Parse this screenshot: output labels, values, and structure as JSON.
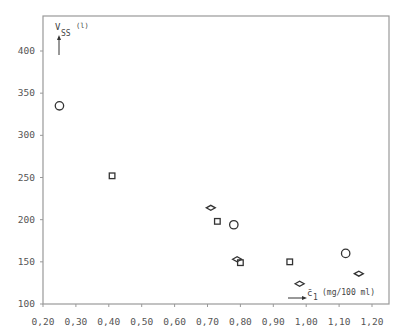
{
  "chart_data": {
    "type": "scatter",
    "title": "",
    "xlabel": "c̄ 1 (mg/100 ml)",
    "ylabel": "V SS (l)",
    "xlim": [
      0.2,
      1.2
    ],
    "ylim": [
      100,
      430
    ],
    "grid": false,
    "legend": "none",
    "x_ticks": [
      "0,20",
      "0,30",
      "0,40",
      "0,50",
      "0,60",
      "0,70",
      "0,80",
      "0,90",
      "1,00",
      "1,10",
      "1,20"
    ],
    "y_ticks": [
      "100",
      "150",
      "200",
      "250",
      "300",
      "350",
      "400"
    ],
    "series": [
      {
        "name": "circle",
        "marker": "circle",
        "points": [
          {
            "x": 0.25,
            "y": 335
          },
          {
            "x": 0.78,
            "y": 194
          },
          {
            "x": 1.12,
            "y": 160
          }
        ]
      },
      {
        "name": "square",
        "marker": "square",
        "points": [
          {
            "x": 0.41,
            "y": 252
          },
          {
            "x": 0.73,
            "y": 198
          },
          {
            "x": 0.8,
            "y": 149
          },
          {
            "x": 0.95,
            "y": 150
          }
        ]
      },
      {
        "name": "diamond",
        "marker": "diamond",
        "points": [
          {
            "x": 0.71,
            "y": 214
          },
          {
            "x": 0.79,
            "y": 153
          },
          {
            "x": 0.98,
            "y": 124
          },
          {
            "x": 1.16,
            "y": 136
          }
        ]
      }
    ]
  },
  "labels": {
    "y_main": "V",
    "y_sub": "SS",
    "y_unit": "(l)",
    "x_main": "c̄",
    "x_sub": "1",
    "x_unit": "(mg/100 ml)"
  }
}
